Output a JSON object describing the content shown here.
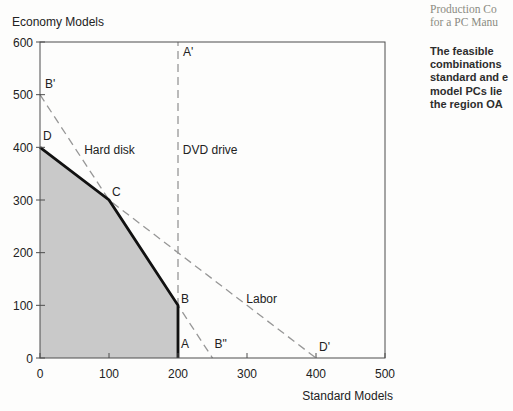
{
  "sidebar": {
    "heading": "Production Co\nfor a PC Manu",
    "body": "The feasible\ncombinations\nstandard and e\nmodel PCs lie\nthe region OA"
  },
  "chart_data": {
    "type": "line",
    "title": "",
    "xlabel": "Standard Models",
    "ylabel": "Economy Models",
    "xlim": [
      0,
      500
    ],
    "ylim": [
      0,
      600
    ],
    "xticks": [
      0,
      100,
      200,
      300,
      400,
      500
    ],
    "yticks": [
      0,
      100,
      200,
      300,
      400,
      500,
      600
    ],
    "grid": false,
    "legend": false,
    "plot_px": {
      "left": 40,
      "top": 42,
      "right": 385,
      "bottom": 358
    },
    "region": {
      "name": "feasible-region",
      "description": "shaded feasible region OABCD",
      "vertices": [
        [
          0,
          0
        ],
        [
          0,
          400
        ],
        [
          100,
          300
        ],
        [
          200,
          100
        ],
        [
          200,
          0
        ]
      ],
      "fill": "#c9c9c9"
    },
    "series": [
      {
        "name": "hard-disk-constraint",
        "label": "Hard disk",
        "style": "dashed",
        "points": [
          [
            0,
            500
          ],
          [
            250,
            0
          ]
        ]
      },
      {
        "name": "labor-constraint",
        "label": "Labor",
        "style": "dashed",
        "points": [
          [
            0,
            400
          ],
          [
            400,
            0
          ]
        ]
      },
      {
        "name": "dvd-drive-constraint",
        "label": "DVD drive",
        "style": "dashed",
        "points": [
          [
            200,
            0
          ],
          [
            200,
            600
          ]
        ]
      },
      {
        "name": "feasible-frontier",
        "label": "",
        "style": "solid",
        "points": [
          [
            0,
            400
          ],
          [
            100,
            300
          ],
          [
            200,
            100
          ],
          [
            200,
            0
          ]
        ]
      }
    ],
    "line_labels": [
      {
        "text": "Hard disk",
        "at": [
          64,
          387
        ]
      },
      {
        "text": "DVD drive",
        "at": [
          207,
          387
        ]
      },
      {
        "text": "Labor",
        "at": [
          299,
          104
        ]
      }
    ],
    "point_labels": [
      {
        "text": "A'",
        "at": [
          200,
          600
        ],
        "dpx": [
          5,
          14
        ]
      },
      {
        "text": "B'",
        "at": [
          0,
          500
        ],
        "dpx": [
          5,
          -7
        ]
      },
      {
        "text": "D",
        "at": [
          0,
          400
        ],
        "dpx": [
          3,
          -7
        ]
      },
      {
        "text": "C",
        "at": [
          100,
          300
        ],
        "dpx": [
          3,
          -4
        ]
      },
      {
        "text": "B",
        "at": [
          200,
          100
        ],
        "dpx": [
          3,
          -2
        ]
      },
      {
        "text": "A",
        "at": [
          200,
          0
        ],
        "dpx": [
          3,
          -10
        ]
      },
      {
        "text": "B\"",
        "at": [
          250,
          0
        ],
        "dpx": [
          2,
          -10
        ]
      },
      {
        "text": "D'",
        "at": [
          400,
          0
        ],
        "dpx": [
          3,
          -7
        ]
      }
    ],
    "colors": {
      "dashed": "#979797",
      "frontier": "#111111",
      "frame": "#4d4d4d",
      "fill": "#c9c9c9",
      "text": "#222222"
    }
  }
}
